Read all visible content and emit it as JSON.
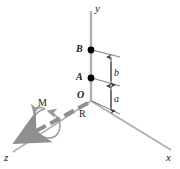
{
  "figure": {
    "background_color": "#ffffff",
    "axis_color": "#a9a9a9",
    "vector_color": "#8f8f8f",
    "dimension_color": "#3c3c3c",
    "point_color": "#000000",
    "label_color": "#1a1a1a"
  },
  "axes": [
    {
      "id": "y",
      "label": "y",
      "direction": "up"
    },
    {
      "id": "x",
      "label": "x",
      "direction": "down-right"
    },
    {
      "id": "z",
      "label": "z",
      "direction": "down-left"
    }
  ],
  "points": [
    {
      "id": "B",
      "label": "B",
      "on_axis": "y"
    },
    {
      "id": "A",
      "label": "A",
      "on_axis": "y"
    },
    {
      "id": "O",
      "label": "O",
      "on_axis": "origin"
    }
  ],
  "dimensions": [
    {
      "id": "b",
      "label": "b",
      "from": "A",
      "to": "B"
    },
    {
      "id": "a",
      "label": "a",
      "from": "O",
      "to": "A"
    }
  ],
  "vectors": [
    {
      "id": "R",
      "label": "R",
      "style": "dashed-arrow",
      "direction": "along-z"
    },
    {
      "id": "M",
      "label": "M",
      "style": "curved-double-arrow",
      "about": "R"
    }
  ]
}
